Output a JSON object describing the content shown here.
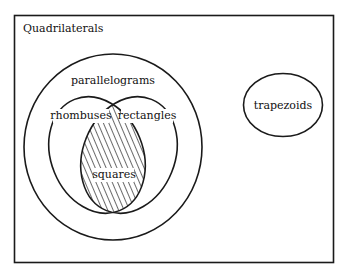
{
  "diagram": {
    "type": "venn",
    "title": "Quadrilaterals",
    "sets": [
      {
        "id": "parallelograms",
        "label": "parallelograms",
        "contains": [
          "rhombuses",
          "rectangles"
        ]
      },
      {
        "id": "rhombuses",
        "label": "rhombuses"
      },
      {
        "id": "rectangles",
        "label": "rectangles"
      },
      {
        "id": "squares",
        "label": "squares",
        "is_intersection_of": [
          "rhombuses",
          "rectangles"
        ],
        "shaded": true
      },
      {
        "id": "trapezoids",
        "label": "trapezoids"
      }
    ],
    "colors": {
      "stroke": "#1a1a1a",
      "background": "#ffffff",
      "hatch": "#1a1a1a"
    }
  }
}
